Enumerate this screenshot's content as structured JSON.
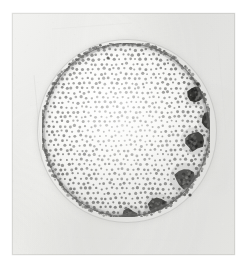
{
  "figure": {
    "domain": "natural-image",
    "caption": "",
    "alt_text": "Black and white photomicrograph of a spherical Volvox colony with a stippled surface of somatic cells and several dark spherical daughter colonies inside",
    "visible_text": []
  },
  "plate": {
    "background_color": "#ffffff",
    "print_color": "#efefed",
    "print_border_color": "#cdcdcb",
    "x": 12,
    "y": 13,
    "width": 223,
    "height": 242
  },
  "colony": {
    "name": "volvox-colony",
    "center_x": 114,
    "center_y": 117,
    "radius_x": 84,
    "radius_y": 87,
    "rim_color": "#60605e",
    "interior_color": "#f6f6f4",
    "cell_dot_color": "#6e6e6c",
    "sheath_color": "#b0b0ae",
    "cell_dot_radius": 1.25,
    "cell_spacing": 5.2,
    "cell_count_estimate": 820
  },
  "daughter_colonies": [
    {
      "name": "daughter-colony-1",
      "cx": 154,
      "cy": 51,
      "r": 8.5,
      "tone": "#1c1c1a",
      "opacity": 0.95
    },
    {
      "name": "daughter-colony-2",
      "cx": 169,
      "cy": 77,
      "r": 9.5,
      "tone": "#1f1f1d",
      "opacity": 0.93
    },
    {
      "name": "daughter-colony-3",
      "cx": 152,
      "cy": 98,
      "r": 9.5,
      "tone": "#2a2a28",
      "opacity": 0.9
    },
    {
      "name": "daughter-colony-4",
      "cx": 143,
      "cy": 135,
      "r": 10.5,
      "tone": "#3a3a38",
      "opacity": 0.88
    },
    {
      "name": "daughter-colony-5",
      "cx": 116,
      "cy": 164,
      "r": 9.5,
      "tone": "#353533",
      "opacity": 0.88
    },
    {
      "name": "daughter-colony-6",
      "cx": 135,
      "cy": 165,
      "r": 8.0,
      "tone": "#3e3e3c",
      "opacity": 0.82
    },
    {
      "name": "daughter-colony-7",
      "cx": 88,
      "cy": 175,
      "r": 9.0,
      "tone": "#3b3b39",
      "opacity": 0.86
    },
    {
      "name": "daughter-colony-8",
      "cx": 161,
      "cy": 174,
      "r": 9.0,
      "tone": "#2d2d2b",
      "opacity": 0.9
    }
  ],
  "specks": [
    {
      "name": "dark-speck-1",
      "cx": 186,
      "cy": 71,
      "r": 1.8,
      "tone": "#2b2b29"
    },
    {
      "name": "dark-speck-2",
      "cx": 178,
      "cy": 182,
      "r": 1.6,
      "tone": "#3a3a38"
    },
    {
      "name": "dark-speck-3",
      "cx": 96,
      "cy": 45,
      "r": 1.5,
      "tone": "#53534f"
    }
  ],
  "plate_marks": [
    {
      "name": "emulsion-streak-left",
      "x1": 22,
      "y1": 62,
      "x2": 30,
      "y2": 148,
      "tone": "#c9c9c7"
    },
    {
      "name": "emulsion-streak-top",
      "x1": 40,
      "y1": 16,
      "x2": 120,
      "y2": 10,
      "tone": "#dcdcda"
    },
    {
      "name": "emulsion-streak-right",
      "x1": 206,
      "y1": 30,
      "x2": 214,
      "y2": 120,
      "tone": "#dadad8"
    },
    {
      "name": "emulsion-streak-bottom",
      "x1": 60,
      "y1": 224,
      "x2": 170,
      "y2": 228,
      "tone": "#dedede"
    }
  ]
}
